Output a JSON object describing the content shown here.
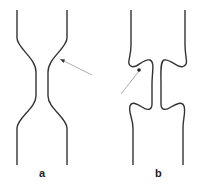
{
  "figure": {
    "panels": [
      {
        "id": "a",
        "label": "a",
        "description": "Smooth symmetric constriction narrowing to a thin gap, arrow pointing at right wall shoulder"
      },
      {
        "id": "b",
        "label": "b",
        "description": "Constriction with interlocking rounded lobes, arrow pointing at left lobe tip"
      }
    ],
    "colors": {
      "stroke": "#333333",
      "arrow": "#888888",
      "background": "#ffffff"
    }
  }
}
